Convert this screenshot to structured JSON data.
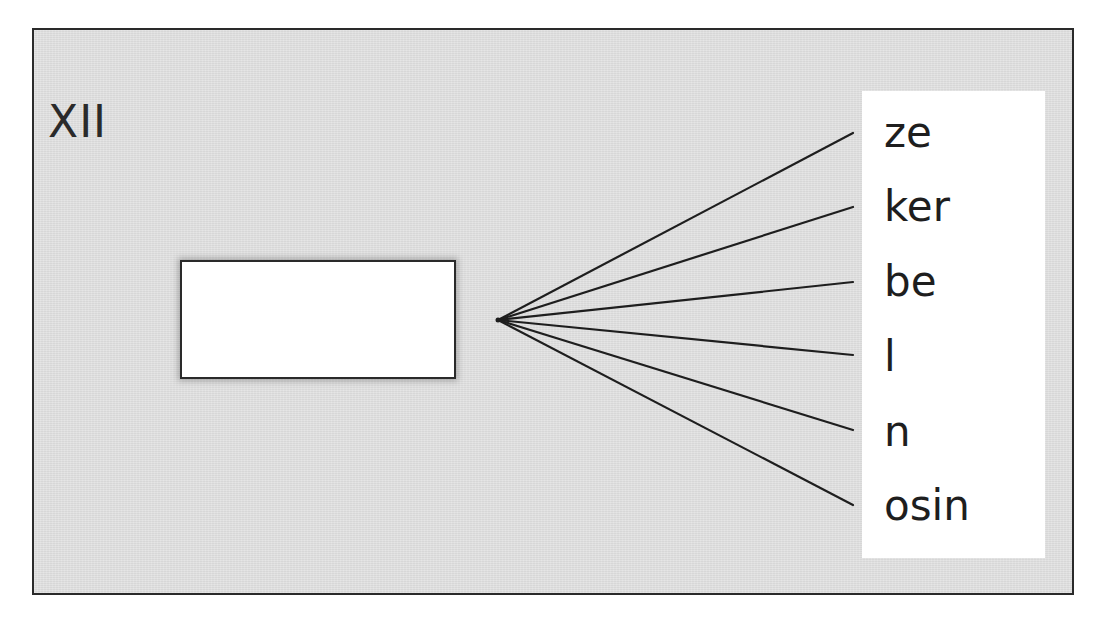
{
  "diagram": {
    "label": "XII",
    "blank_box": {
      "content": ""
    },
    "suffixes": [
      "ze",
      "ker",
      "be",
      "l",
      "n",
      "osin"
    ],
    "colors": {
      "frame_background": "#e2e2e2",
      "line": "#1e1e1e",
      "panel": "#ffffff",
      "text": "#1e1e1e"
    }
  }
}
